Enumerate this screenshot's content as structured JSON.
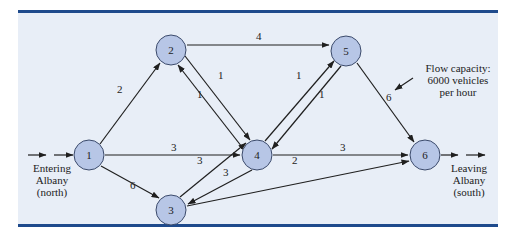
{
  "diagram": {
    "nodes": [
      {
        "id": "1",
        "label": "1",
        "x": 89,
        "y": 155
      },
      {
        "id": "2",
        "label": "2",
        "x": 171,
        "y": 50
      },
      {
        "id": "3",
        "label": "3",
        "x": 171,
        "y": 210
      },
      {
        "id": "4",
        "label": "4",
        "x": 257,
        "y": 155
      },
      {
        "id": "5",
        "label": "5",
        "x": 346,
        "y": 51
      },
      {
        "id": "6",
        "label": "6",
        "x": 425,
        "y": 155
      }
    ],
    "edges": [
      {
        "from": "1",
        "to": "2",
        "capacity": "2"
      },
      {
        "from": "1",
        "to": "4",
        "capacity": "3"
      },
      {
        "from": "1",
        "to": "3",
        "capacity": "6"
      },
      {
        "from": "2",
        "to": "5",
        "capacity": "4"
      },
      {
        "from": "2",
        "to": "4",
        "capacity": "1"
      },
      {
        "from": "4",
        "to": "2",
        "capacity": "1"
      },
      {
        "from": "3",
        "to": "4",
        "capacity": "3"
      },
      {
        "from": "4",
        "to": "3",
        "capacity": "3"
      },
      {
        "from": "4",
        "to": "5",
        "capacity": "1"
      },
      {
        "from": "5",
        "to": "4",
        "capacity": "1"
      },
      {
        "from": "4",
        "to": "6",
        "capacity": "3"
      },
      {
        "from": "5",
        "to": "6",
        "capacity": "6"
      },
      {
        "from": "3",
        "to": "6",
        "capacity": "2"
      }
    ],
    "entry_label": [
      "Entering",
      "Albany",
      "(north)"
    ],
    "exit_label": [
      "Leaving",
      "Albany",
      "(south)"
    ],
    "annotation": [
      "Flow capacity:",
      "6000 vehicles",
      "per hour"
    ]
  },
  "colors": {
    "panel_bg": "#e8eef7",
    "rule": "#1e4a8c",
    "node_fill": "#b7c6e6"
  }
}
